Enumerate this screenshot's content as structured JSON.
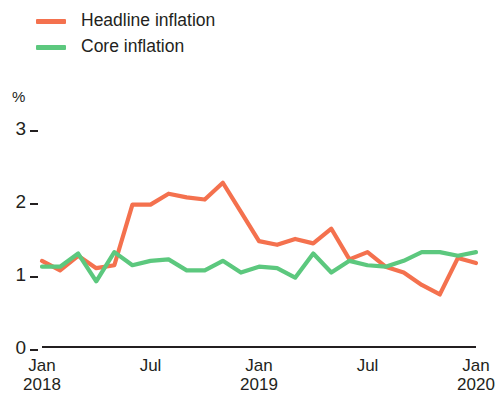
{
  "legend": {
    "position": "top-left",
    "items": [
      {
        "label": "Headline inflation",
        "color": "#F4714E",
        "name": "headline"
      },
      {
        "label": "Core inflation",
        "color": "#5CC87E",
        "name": "core"
      }
    ]
  },
  "axes": {
    "unit": "%",
    "y_ticks": [
      "0",
      "1",
      "2",
      "3"
    ],
    "x_ticks": [
      {
        "month": "Jan",
        "year": "2018"
      },
      {
        "month": "Jul",
        "year": ""
      },
      {
        "month": "Jan",
        "year": "2019"
      },
      {
        "month": "Jul",
        "year": ""
      },
      {
        "month": "Jan",
        "year": "2020"
      }
    ]
  },
  "chart_data": {
    "type": "line",
    "title": "",
    "subtitle": "",
    "xlabel": "",
    "ylabel": "%",
    "ylim": [
      0,
      3
    ],
    "yticks": [
      0,
      1,
      2,
      3
    ],
    "grid": false,
    "legend_position": "top-left",
    "x": [
      "Jan 2018",
      "Feb 2018",
      "Mar 2018",
      "Apr 2018",
      "May 2018",
      "Jun 2018",
      "Jul 2018",
      "Aug 2018",
      "Sep 2018",
      "Oct 2018",
      "Nov 2018",
      "Dec 2018",
      "Jan 2019",
      "Feb 2019",
      "Mar 2019",
      "Apr 2019",
      "May 2019",
      "Jun 2019",
      "Jul 2019",
      "Aug 2019",
      "Sep 2019",
      "Oct 2019",
      "Nov 2019",
      "Dec 2019",
      "Jan 2020"
    ],
    "xtick_labels": [
      "Jan 2018",
      "Jul",
      "Jan 2019",
      "Jul",
      "Jan 2020"
    ],
    "xtick_indices": [
      0,
      6,
      12,
      18,
      24
    ],
    "series": [
      {
        "name": "Headline inflation",
        "color": "#F4714E",
        "values": [
          1.18,
          1.05,
          1.25,
          1.08,
          1.12,
          1.95,
          1.95,
          2.1,
          2.05,
          2.02,
          2.25,
          1.85,
          1.45,
          1.4,
          1.48,
          1.42,
          1.62,
          1.2,
          1.3,
          1.1,
          1.02,
          0.85,
          0.72,
          1.22,
          1.15
        ]
      },
      {
        "name": "Core inflation",
        "color": "#5CC87E",
        "values": [
          1.1,
          1.1,
          1.28,
          0.9,
          1.3,
          1.12,
          1.18,
          1.2,
          1.05,
          1.05,
          1.18,
          1.02,
          1.1,
          1.08,
          0.95,
          1.28,
          1.02,
          1.18,
          1.12,
          1.1,
          1.18,
          1.3,
          1.3,
          1.25,
          1.3
        ]
      }
    ]
  }
}
